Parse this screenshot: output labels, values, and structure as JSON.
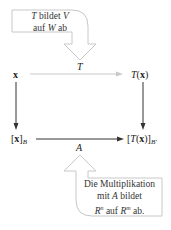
{
  "diagram": {
    "top_callout": {
      "line1": {
        "italic": "T",
        "rest": " bildet ",
        "italic2": "V"
      },
      "line2": {
        "pre": "auf ",
        "italic": "W",
        "rest": " ab"
      }
    },
    "nodes": {
      "x": "x",
      "Tx_T": "T",
      "Tx_paren": "(x)",
      "xB_base": "[x]",
      "xB_sub": "B",
      "TxB_open": "[",
      "TxB_T": "T",
      "TxB_mid": "(x)]",
      "TxB_sub": "B′"
    },
    "edges": {
      "top_label": "T",
      "bottom_label": "A"
    },
    "bottom_callout": {
      "line1": "Die Multiplikation",
      "line2": {
        "pre": "mit ",
        "italic": "A",
        "rest": " bildet"
      },
      "line3": {
        "R1": "R",
        "sup1": "n",
        "mid": " auf ",
        "R2": "R",
        "sup2": "m",
        "rest": " ab."
      }
    },
    "colors": {
      "arrow_dark": "#333333",
      "arrow_light": "#c8c8c8",
      "callout_stroke": "#c8c8c8"
    }
  }
}
